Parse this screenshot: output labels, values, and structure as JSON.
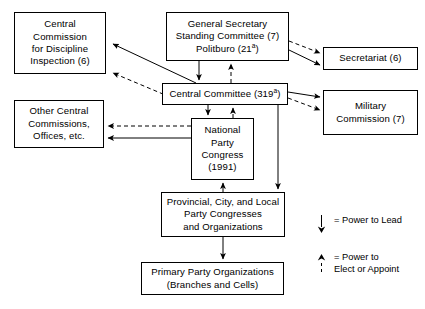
{
  "diagram": {
    "type": "org-flow",
    "stroke_color": "#000000",
    "background_color": "#ffffff",
    "nodes": [
      {
        "id": "ccdi",
        "name": "central-commission-discipline-inspection",
        "lines": [
          "Central",
          "Commission",
          "for Discipline",
          "Inspection (6)"
        ],
        "x": 14,
        "y": 12,
        "w": 92,
        "h": 62
      },
      {
        "id": "gs",
        "name": "general-secretary-standing-committee-politburo",
        "lines": [
          "General Secretary",
          "Standing Committee (7)",
          "Politburo (21a)"
        ],
        "x": 166,
        "y": 12,
        "w": 123,
        "h": 49
      },
      {
        "id": "secretariat",
        "name": "secretariat",
        "lines": [
          "Secretariat (6)"
        ],
        "x": 323,
        "y": 47,
        "w": 95,
        "h": 23
      },
      {
        "id": "cc",
        "name": "central-committee",
        "lines": [
          "Central Committee (319a)"
        ],
        "x": 162,
        "y": 83,
        "w": 126,
        "h": 22
      },
      {
        "id": "military",
        "name": "military-commission",
        "lines": [
          "Military",
          "Commission (7)"
        ],
        "x": 323,
        "y": 90,
        "w": 95,
        "h": 45
      },
      {
        "id": "other",
        "name": "other-central-commissions-offices",
        "lines": [
          "Other Central",
          "Commissions,",
          "Offices, etc."
        ],
        "x": 14,
        "y": 100,
        "w": 90,
        "h": 48
      },
      {
        "id": "npc",
        "name": "national-party-congress",
        "lines": [
          "National",
          "Party",
          "Congress",
          "(1991)"
        ],
        "x": 191,
        "y": 118,
        "w": 63,
        "h": 62
      },
      {
        "id": "provincial",
        "name": "provincial-city-local-party-congresses",
        "lines": [
          "Provincial, City, and Local",
          "Party Congresses",
          "and Organizations"
        ],
        "x": 161,
        "y": 192,
        "w": 124,
        "h": 45
      },
      {
        "id": "primary",
        "name": "primary-party-organizations",
        "lines": [
          "Primary Party Organizations",
          "(Branches and Cells)"
        ],
        "x": 141,
        "y": 262,
        "w": 143,
        "h": 33
      }
    ],
    "legend": [
      {
        "id": "lead",
        "name": "legend-power-to-lead",
        "style": "solid",
        "direction": "down",
        "lines": [
          "= Power to Lead"
        ]
      },
      {
        "id": "elect",
        "name": "legend-power-to-elect-or-appoint",
        "style": "dashed",
        "direction": "up",
        "lines": [
          "= Power to",
          "Elect or Appoint"
        ]
      }
    ],
    "edges": [
      {
        "name": "edge-cc-to-ccdi",
        "from": "cc",
        "to": "ccdi",
        "style": "solid",
        "meaning": "Power to Lead"
      },
      {
        "name": "edge-ccdi-to-cc",
        "from": "ccdi",
        "to": "cc",
        "style": "dashed",
        "meaning": "Power to Elect or Appoint"
      },
      {
        "name": "edge-gs-to-cc",
        "from": "gs",
        "to": "cc",
        "style": "solid",
        "meaning": "Power to Lead"
      },
      {
        "name": "edge-cc-to-gs",
        "from": "cc",
        "to": "gs",
        "style": "dashed",
        "meaning": "Power to Elect or Appoint"
      },
      {
        "name": "edge-gs-to-secretariat-lead",
        "from": "gs",
        "to": "secretariat",
        "style": "solid",
        "meaning": "Power to Lead"
      },
      {
        "name": "edge-gs-to-secretariat-appoint",
        "from": "gs",
        "to": "secretariat",
        "style": "dashed",
        "meaning": "Power to Elect or Appoint"
      },
      {
        "name": "edge-cc-to-military-lead",
        "from": "cc",
        "to": "military",
        "style": "solid",
        "meaning": "Power to Lead"
      },
      {
        "name": "edge-cc-to-military-appoint",
        "from": "cc",
        "to": "military",
        "style": "dashed",
        "meaning": "Power to Elect or Appoint"
      },
      {
        "name": "edge-cc-to-npc-lead",
        "from": "cc",
        "to": "npc",
        "style": "solid",
        "meaning": "Power to Lead"
      },
      {
        "name": "edge-npc-to-cc-elect",
        "from": "npc",
        "to": "cc",
        "style": "dashed",
        "meaning": "Power to Elect or Appoint"
      },
      {
        "name": "edge-npc-to-other-lead",
        "from": "npc",
        "to": "other",
        "style": "solid",
        "meaning": "Power to Lead"
      },
      {
        "name": "edge-npc-to-other-appoint",
        "from": "npc",
        "to": "other",
        "style": "dashed",
        "meaning": "Power to Elect or Appoint"
      },
      {
        "name": "edge-cc-to-provincial",
        "from": "cc",
        "to": "provincial",
        "style": "solid",
        "meaning": "Power to Lead"
      },
      {
        "name": "edge-provincial-to-npc",
        "from": "provincial",
        "to": "npc",
        "style": "dashed",
        "meaning": "Power to Elect or Appoint"
      },
      {
        "name": "edge-provincial-to-primary",
        "from": "provincial",
        "to": "primary",
        "style": "solid",
        "meaning": "Power to Lead"
      }
    ]
  }
}
